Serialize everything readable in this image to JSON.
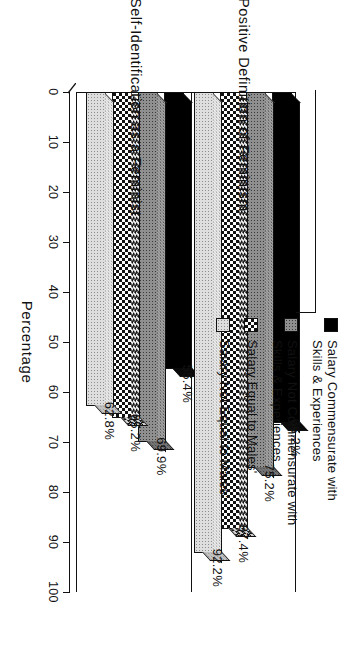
{
  "chart_data": {
    "type": "bar",
    "title": "",
    "orientation": "horizontal-3d",
    "xlabel": "Percentage",
    "ylabel": "",
    "ylim": [
      0,
      100
    ],
    "grid": false,
    "legend_position": "top-right",
    "tick_labels": [
      "0",
      "10",
      "20",
      "30",
      "40",
      "50",
      "60",
      "70",
      "80",
      "90",
      "100"
    ],
    "tick_values": [
      0,
      10,
      20,
      30,
      40,
      50,
      60,
      70,
      80,
      90,
      100
    ],
    "categories": [
      "Self-Identification as a Feminist",
      "Positive Definition of Feminism"
    ],
    "series": [
      {
        "name": "Salary Commensurate with\nSkills & Experiences",
        "pattern": "solid-black",
        "values": [
          55.4,
          66.2
        ],
        "labels": [
          "55.4%",
          "66.2%"
        ]
      },
      {
        "name": "Salary Not Commensurate with\nSkills & Experiences",
        "pattern": "medium-gray-dotted",
        "values": [
          69.9,
          75.2
        ],
        "labels": [
          "69.9%",
          "75.2%"
        ]
      },
      {
        "name": "Salary Equal to Males'",
        "pattern": "checkerboard",
        "values": [
          65.2,
          87.4
        ],
        "labels": [
          "65.2%",
          "87.4%"
        ]
      },
      {
        "name": "Salary Not Equal to Males'",
        "pattern": "light-dotted",
        "values": [
          62.8,
          92.2
        ],
        "labels": [
          "62.8%",
          "92.2%"
        ]
      }
    ]
  },
  "axis": {
    "value_axis_title": "Percentage",
    "tick_labels": [
      "0",
      "10",
      "20",
      "30",
      "40",
      "50",
      "60",
      "70",
      "80",
      "90",
      "100"
    ]
  },
  "category_labels": [
    "Self-Identification as a Feminist",
    "Positive Definition of Feminism"
  ],
  "legend": {
    "items": [
      {
        "label": "Salary Commensurate with\nSkills & Experiences",
        "swatch": "solid-black-swatch"
      },
      {
        "label": "Salary Not Commensurate with\nSkills & Experiences",
        "swatch": "medium-gray-dotted-swatch"
      },
      {
        "label": "Salary Equal to Males'",
        "swatch": "checkerboard-swatch"
      },
      {
        "label": "Salary Not Equal to Males'",
        "swatch": "light-dotted-swatch"
      }
    ]
  },
  "bar_labels": {
    "group1": [
      "55.4%",
      "69.9%",
      "65.2%",
      "62.8%"
    ],
    "group2": [
      "66.2%",
      "75.2%",
      "87.4%",
      "92.2%"
    ]
  },
  "colors": {
    "ink": "#111111",
    "background": "#ffffff",
    "series_solid": "#000000",
    "series_medium": "#8f8f8f",
    "series_check": "#ffffff",
    "series_light": "#dedede"
  }
}
